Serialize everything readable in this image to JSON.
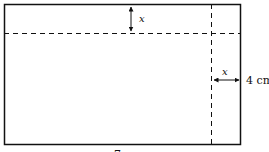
{
  "diagram": {
    "labels": {
      "top_x": "x",
      "right_x": "x",
      "right_dimension": "4 cm",
      "bottom_label": "7"
    },
    "colors": {
      "stroke": "#111111",
      "background": "#ffffff"
    }
  }
}
